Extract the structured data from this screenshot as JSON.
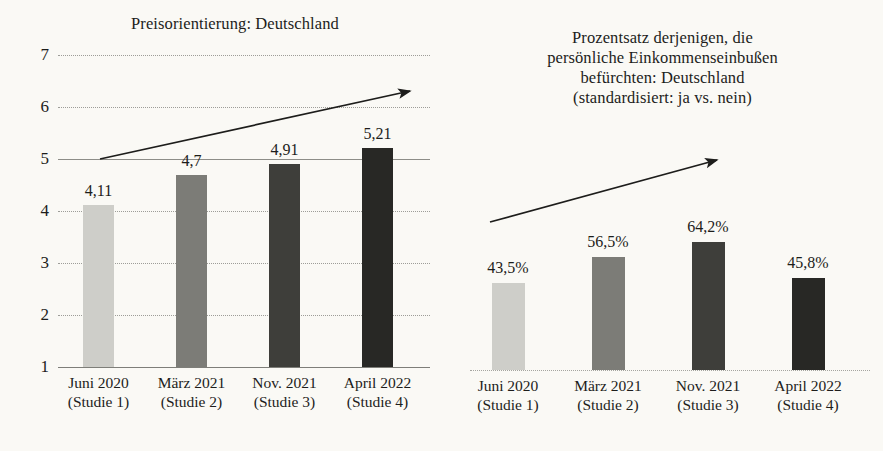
{
  "figure": {
    "background_color": "#faf9f5",
    "text_color": "#1d1d1b"
  },
  "chart_data": [
    {
      "id": "left",
      "type": "bar",
      "title": "Preisorientierung: Deutschland",
      "xlabel": "",
      "ylabel": "",
      "ylim": [
        1,
        7
      ],
      "yticks": [
        "7",
        "6",
        "5",
        "4",
        "3",
        "2",
        "1"
      ],
      "ytick_values": [
        7,
        6,
        5,
        4,
        3,
        2,
        1
      ],
      "grid": true,
      "legend": "none",
      "categories": [
        "Juni 2020\n(Studie 1)",
        "März 2021\n(Studie 2)",
        "Nov. 2021\n(Studie 3)",
        "April 2022\n(Studie 4)"
      ],
      "category_lines": [
        [
          "Juni 2020",
          "(Studie 1)"
        ],
        [
          "März 2021",
          "(Studie 2)"
        ],
        [
          "Nov. 2021",
          "(Studie 3)"
        ],
        [
          "April 2022",
          "(Studie 4)"
        ]
      ],
      "values": [
        4.11,
        4.7,
        4.91,
        5.21
      ],
      "value_labels": [
        "4,11",
        "4,7",
        "4,91",
        "5,21"
      ],
      "bar_colors": [
        "#cecec9",
        "#7c7c77",
        "#3e3e3a",
        "#282825"
      ],
      "annotation": {
        "type": "trend-arrow",
        "direction": "up",
        "from": [
          4.98,
          5.0
        ],
        "to": [
          412,
          90
        ]
      }
    },
    {
      "id": "right",
      "type": "bar",
      "title_lines": [
        "Prozentsatz derjenigen, die",
        "persönliche Einkommenseinbußen",
        "befürchten: Deutschland",
        "(standardisiert: ja vs. nein)"
      ],
      "title": "Prozentsatz derjenigen, die persönliche Einkommenseinbußen befürchten: Deutschland (standardisiert: ja vs. nein)",
      "xlabel": "",
      "ylabel": "",
      "ylim": [
        0,
        100
      ],
      "yticks": [],
      "grid": false,
      "legend": "none",
      "categories": [
        "Juni 2020\n(Studie 1)",
        "März 2021\n(Studie 2)",
        "Nov. 2021\n(Studie 3)",
        "April 2022\n(Studie 4)"
      ],
      "category_lines": [
        [
          "Juni 2020",
          "(Studie 1)"
        ],
        [
          "März 2021",
          "(Studie 2)"
        ],
        [
          "Nov. 2021",
          "(Studie 3)"
        ],
        [
          "April 2022",
          "(Studie 4)"
        ]
      ],
      "values": [
        43.5,
        56.5,
        64.2,
        45.8
      ],
      "value_labels": [
        "43,5%",
        "56,5%",
        "64,2%",
        "45,8%"
      ],
      "bar_colors": [
        "#cecec9",
        "#7c7c77",
        "#3e3e3a",
        "#282825"
      ],
      "annotation": {
        "type": "trend-arrow",
        "direction": "up"
      }
    }
  ]
}
